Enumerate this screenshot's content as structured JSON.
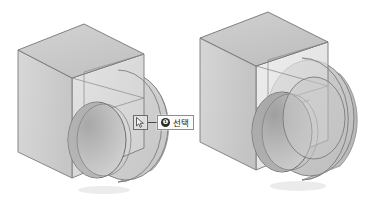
{
  "figure": {
    "title": "",
    "background_color": "#ffffff",
    "panel_count": 2
  },
  "colors": {
    "face_top": "#c9c9c9",
    "face_left": "#cfcfcf",
    "face_front": "#dcdcdc",
    "face_inner": "#b4b4b4",
    "outline": "#6f6f6f",
    "outline_light": "#9a9a9a",
    "badge_bg": "#2b2b2b",
    "badge_text": "#ffffff",
    "label_bg": "#fbfbfb",
    "label_border": "#8d8d8d",
    "leader_line": "#4a4a4a",
    "cursor_box_border": "#6d6d6d"
  },
  "panels": [
    {
      "id": "panel-left",
      "name": "step-1-single-face-selection",
      "model": {
        "name": "box-with-cylindrical-boss-and-bore",
        "shading": "opaque",
        "state": "one-face-selected"
      },
      "callout": {
        "number": "❶",
        "number_value": "1",
        "text": "선택",
        "cursor_icon": "arrow-cursor-icon"
      }
    },
    {
      "id": "panel-right",
      "name": "step-2-multi-face-selection",
      "model": {
        "name": "box-with-cylindrical-boss-and-bore",
        "shading": "translucent-highlighted",
        "state": "two-faces-selected"
      },
      "callout": {
        "number": "❷",
        "number_value": "2",
        "text": "Shift + 선택",
        "cursor_icon": "arrow-cursor-icon"
      }
    }
  ]
}
